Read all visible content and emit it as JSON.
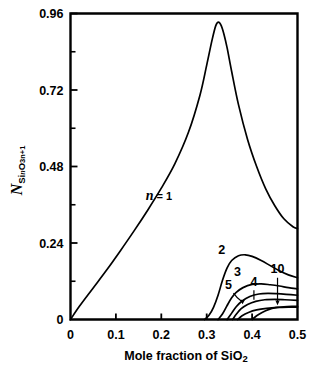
{
  "chart_data": {
    "type": "line",
    "title": "",
    "xlabel": "Mole fraction of SiO2",
    "xlabel_parts": {
      "main": "Mole  fraction  of  SiO",
      "sub": "2"
    },
    "ylabel": "N_SinO3n+1",
    "ylabel_parts": {
      "main": "N",
      "sub": "Si",
      "sub_italic": "n",
      "sub2": "O",
      "sub3": "3n+1"
    },
    "xlim": [
      0,
      0.5
    ],
    "ylim": [
      0,
      0.96
    ],
    "xticks": [
      "0",
      "0.1",
      "0.2",
      "0.3",
      "0.4",
      "0.5"
    ],
    "xtick_values": [
      0,
      0.1,
      0.2,
      0.3,
      0.4,
      0.5
    ],
    "yticks": [
      "0",
      "0.24",
      "0.48",
      "0.72",
      "0.96"
    ],
    "ytick_values": [
      0,
      0.24,
      0.48,
      0.72,
      0.96
    ],
    "ytick_minor_values": [
      0.12,
      0.36,
      0.6,
      0.84
    ],
    "grid": false,
    "legend": "inline-curve-labels",
    "annotations": [
      {
        "text": "n = 1",
        "x": 0.195,
        "y": 0.375
      },
      {
        "text": "2",
        "x": 0.333,
        "y": 0.205
      },
      {
        "text": "3",
        "x": 0.368,
        "y": 0.135
      },
      {
        "text": "4",
        "x": 0.404,
        "y": 0.105
      },
      {
        "text": "5",
        "x": 0.348,
        "y": 0.095
      },
      {
        "text": "10",
        "x": 0.456,
        "y": 0.145
      }
    ],
    "series": [
      {
        "name": "n = 1",
        "label": "1",
        "x": [
          0,
          0.02,
          0.05,
          0.08,
          0.11,
          0.14,
          0.17,
          0.2,
          0.23,
          0.26,
          0.285,
          0.3,
          0.312,
          0.32,
          0.326,
          0.332,
          0.338,
          0.345,
          0.355,
          0.37,
          0.39,
          0.41,
          0.43,
          0.45,
          0.47,
          0.49,
          0.5
        ],
        "y": [
          0,
          0.042,
          0.099,
          0.156,
          0.216,
          0.278,
          0.343,
          0.412,
          0.489,
          0.588,
          0.703,
          0.798,
          0.878,
          0.922,
          0.933,
          0.922,
          0.895,
          0.852,
          0.778,
          0.674,
          0.565,
          0.48,
          0.41,
          0.357,
          0.316,
          0.291,
          0.285
        ]
      },
      {
        "name": "n = 2",
        "label": "2",
        "x": [
          0.295,
          0.305,
          0.315,
          0.325,
          0.335,
          0.345,
          0.355,
          0.37,
          0.385,
          0.4,
          0.42,
          0.44,
          0.46,
          0.48,
          0.5
        ],
        "y": [
          0,
          0.013,
          0.038,
          0.076,
          0.124,
          0.162,
          0.185,
          0.2,
          0.203,
          0.198,
          0.185,
          0.169,
          0.153,
          0.14,
          0.131
        ]
      },
      {
        "name": "n = 3",
        "label": "3",
        "x": [
          0.325,
          0.335,
          0.345,
          0.355,
          0.365,
          0.38,
          0.4,
          0.42,
          0.44,
          0.46,
          0.48,
          0.5
        ],
        "y": [
          0,
          0.018,
          0.044,
          0.068,
          0.085,
          0.1,
          0.11,
          0.112,
          0.109,
          0.105,
          0.1,
          0.096
        ]
      },
      {
        "name": "n = 4",
        "label": "4",
        "x": [
          0.345,
          0.355,
          0.365,
          0.378,
          0.395,
          0.415,
          0.435,
          0.455,
          0.475,
          0.5
        ],
        "y": [
          0,
          0.02,
          0.04,
          0.058,
          0.072,
          0.08,
          0.082,
          0.081,
          0.079,
          0.076
        ]
      },
      {
        "name": "n = 5",
        "label": "5",
        "x": [
          0.357,
          0.366,
          0.376,
          0.39,
          0.408,
          0.428,
          0.45,
          0.472,
          0.5
        ],
        "y": [
          0,
          0.018,
          0.034,
          0.047,
          0.057,
          0.062,
          0.063,
          0.062,
          0.06
        ]
      },
      {
        "name": "n = 10",
        "label": "10",
        "x": [
          0.4,
          0.41,
          0.422,
          0.436,
          0.452,
          0.47,
          0.49,
          0.5
        ],
        "y": [
          0,
          0.012,
          0.022,
          0.031,
          0.037,
          0.04,
          0.041,
          0.041
        ]
      },
      {
        "name": "lower-envelope",
        "label": "",
        "x": [
          0.368,
          0.378,
          0.392,
          0.41,
          0.432,
          0.456,
          0.48,
          0.5
        ],
        "y": [
          0,
          0.012,
          0.022,
          0.03,
          0.035,
          0.038,
          0.039,
          0.039
        ]
      }
    ]
  }
}
